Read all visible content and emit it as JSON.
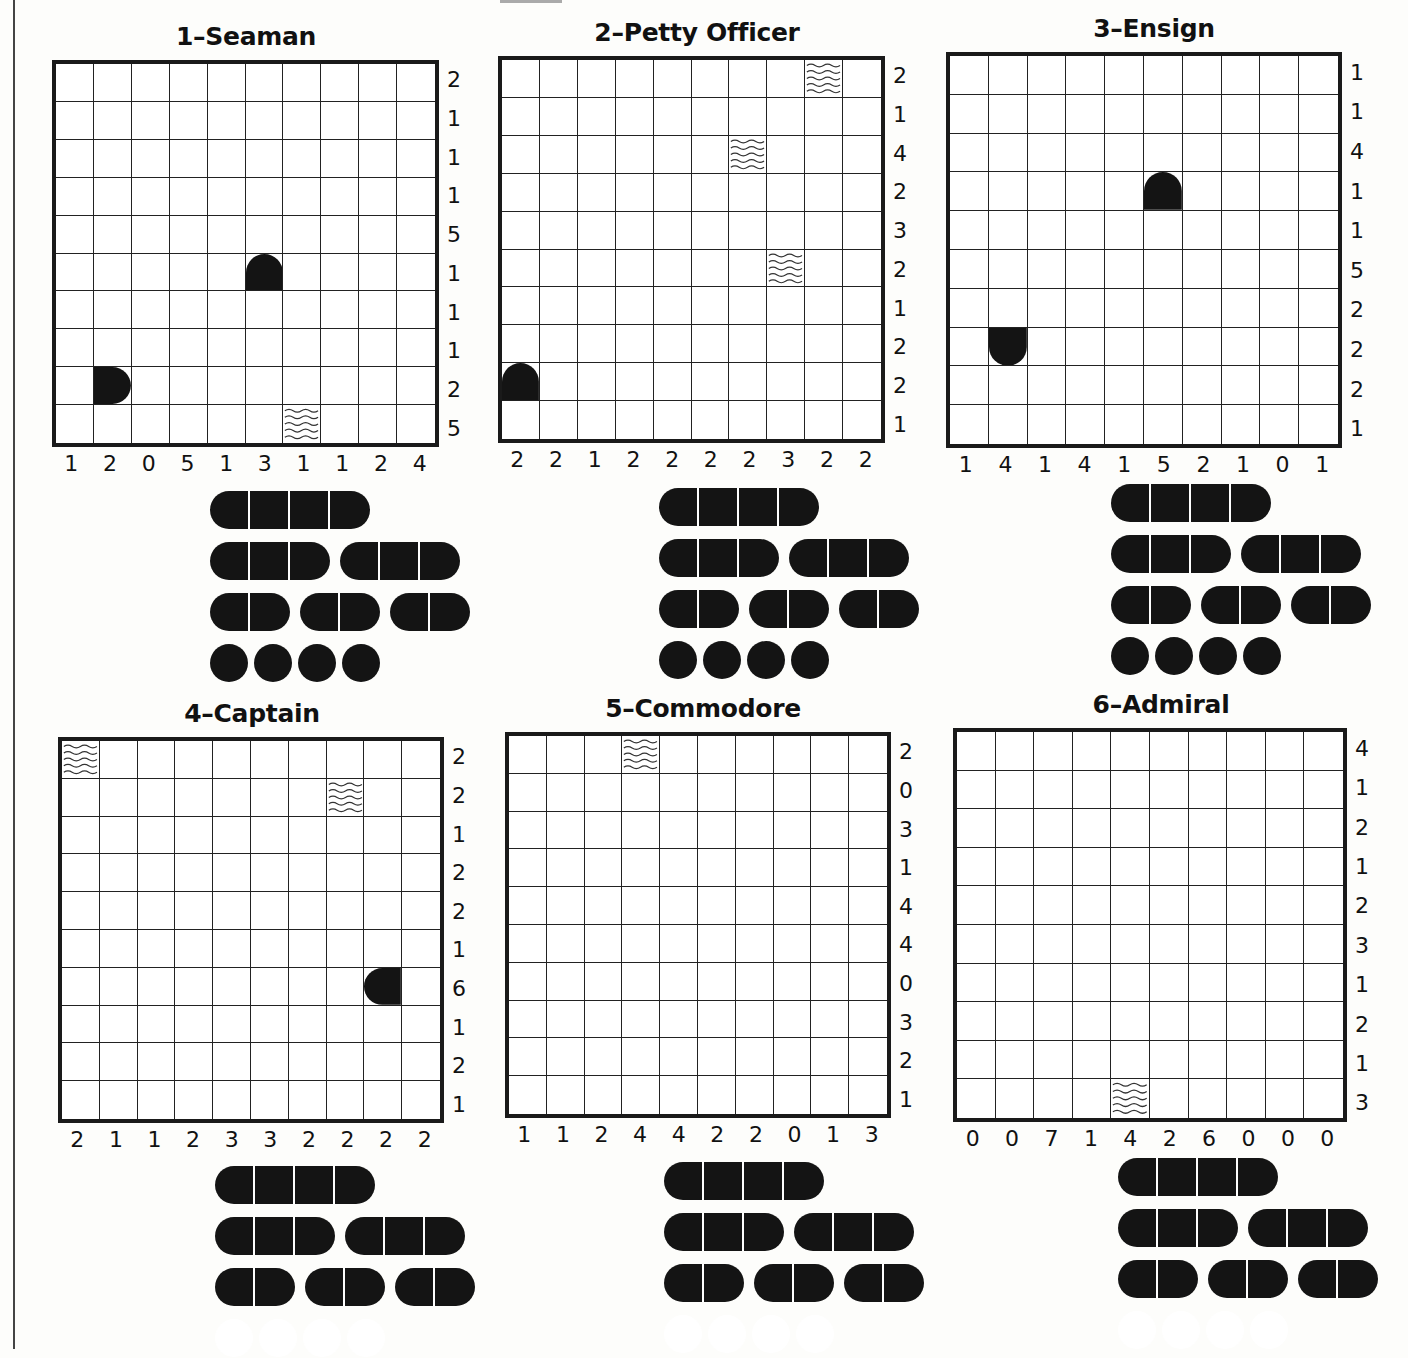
{
  "puzzles": [
    {
      "title": "1–Seaman",
      "grid": {
        "left": 52,
        "top": 60,
        "size": 387
      },
      "title_pos": {
        "x": 246,
        "y": 22
      },
      "row_clues": [
        "2",
        "1",
        "1",
        "1",
        "5",
        "1",
        "1",
        "1",
        "2",
        "5"
      ],
      "col_clues": [
        "1",
        "2",
        "0",
        "5",
        "1",
        "3",
        "1",
        "1",
        "2",
        "4"
      ],
      "givens": [
        {
          "row": 5,
          "col": 5,
          "type": "end-top"
        },
        {
          "row": 8,
          "col": 1,
          "type": "end-right"
        },
        {
          "row": 9,
          "col": 6,
          "type": "water"
        }
      ],
      "fleet_pos": {
        "label_right": 196,
        "ship_left": 210,
        "top": 490
      }
    },
    {
      "title": "2–Petty Officer",
      "grid": {
        "left": 498,
        "top": 56,
        "size": 387
      },
      "title_pos": {
        "x": 697,
        "y": 18
      },
      "row_clues": [
        "2",
        "1",
        "4",
        "2",
        "3",
        "2",
        "1",
        "2",
        "2",
        "1"
      ],
      "col_clues": [
        "2",
        "2",
        "1",
        "2",
        "2",
        "2",
        "2",
        "3",
        "2",
        "2"
      ],
      "givens": [
        {
          "row": 0,
          "col": 8,
          "type": "water"
        },
        {
          "row": 2,
          "col": 6,
          "type": "water"
        },
        {
          "row": 5,
          "col": 7,
          "type": "water"
        },
        {
          "row": 8,
          "col": 0,
          "type": "end-top"
        }
      ],
      "fleet_pos": {
        "label_right": 644,
        "ship_left": 659,
        "top": 487
      }
    },
    {
      "title": "3–Ensign",
      "grid": {
        "left": 946,
        "top": 52,
        "size": 396
      },
      "title_pos": {
        "x": 1154,
        "y": 14
      },
      "row_clues": [
        "1",
        "1",
        "4",
        "1",
        "1",
        "5",
        "2",
        "2",
        "2",
        "1"
      ],
      "col_clues": [
        "1",
        "4",
        "1",
        "4",
        "1",
        "5",
        "2",
        "1",
        "0",
        "1"
      ],
      "givens": [
        {
          "row": 3,
          "col": 5,
          "type": "end-top"
        },
        {
          "row": 7,
          "col": 1,
          "type": "end-bottom"
        }
      ],
      "fleet_pos": {
        "label_right": 1097,
        "ship_left": 1111,
        "top": 483
      }
    },
    {
      "title": "4–Captain",
      "grid": {
        "left": 58,
        "top": 737,
        "size": 386
      },
      "title_pos": {
        "x": 252,
        "y": 699
      },
      "row_clues": [
        "2",
        "2",
        "1",
        "2",
        "2",
        "1",
        "6",
        "1",
        "2",
        "1"
      ],
      "col_clues": [
        "2",
        "1",
        "1",
        "2",
        "3",
        "3",
        "2",
        "2",
        "2",
        "2"
      ],
      "givens": [
        {
          "row": 0,
          "col": 0,
          "type": "water"
        },
        {
          "row": 1,
          "col": 7,
          "type": "water"
        },
        {
          "row": 6,
          "col": 8,
          "type": "end-left"
        }
      ],
      "fleet_pos": {
        "label_right": 200,
        "ship_left": 215,
        "top": 1165
      }
    },
    {
      "title": "5–Commodore",
      "grid": {
        "left": 505,
        "top": 732,
        "size": 386
      },
      "title_pos": {
        "x": 703,
        "y": 694
      },
      "row_clues": [
        "2",
        "0",
        "3",
        "1",
        "4",
        "4",
        "0",
        "3",
        "2",
        "1"
      ],
      "col_clues": [
        "1",
        "1",
        "2",
        "4",
        "4",
        "2",
        "2",
        "0",
        "1",
        "3"
      ],
      "givens": [
        {
          "row": 0,
          "col": 3,
          "type": "water"
        }
      ],
      "fleet_pos": {
        "label_right": 650,
        "ship_left": 664,
        "top": 1161
      }
    },
    {
      "title": "6–Admiral",
      "grid": {
        "left": 953,
        "top": 728,
        "size": 394
      },
      "title_pos": {
        "x": 1161,
        "y": 690
      },
      "row_clues": [
        "4",
        "1",
        "2",
        "1",
        "2",
        "3",
        "1",
        "2",
        "1",
        "3"
      ],
      "col_clues": [
        "0",
        "0",
        "7",
        "1",
        "4",
        "2",
        "6",
        "0",
        "0",
        "0"
      ],
      "givens": [
        {
          "row": 9,
          "col": 4,
          "type": "water"
        }
      ],
      "fleet_pos": {
        "label_right": 1103,
        "ship_left": 1118,
        "top": 1157
      }
    }
  ],
  "fleet_labels": {
    "battleship": "Battleship",
    "cruisers": "Cruisers",
    "destroyers": "Destroyers",
    "submarines": "Submarines"
  },
  "fleet_spec": {
    "battleship": {
      "count": 1,
      "length": 4
    },
    "cruisers": {
      "count": 2,
      "length": 3
    },
    "destroyers": {
      "count": 3,
      "length": 2
    },
    "submarines": {
      "count": 4,
      "length": 1
    }
  },
  "submarines_faded": [
    false,
    false,
    false,
    true,
    true,
    true
  ],
  "colors": {
    "ink": "#141414",
    "grid_line": "#222222",
    "paper": "#fdfdfb"
  }
}
